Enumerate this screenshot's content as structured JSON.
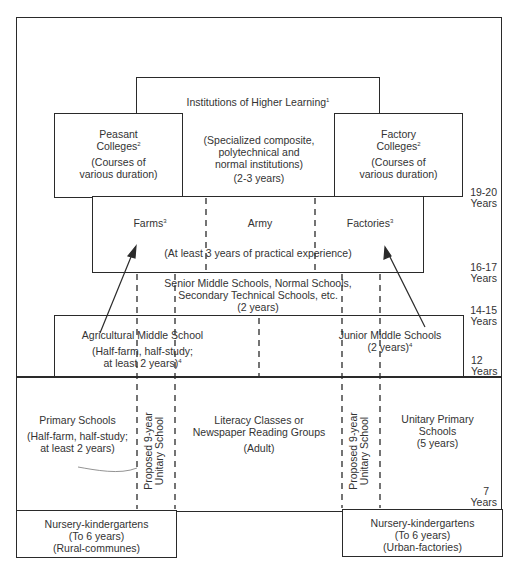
{
  "higher_learning": {
    "title": "Institutions of Higher Learning",
    "footnote": "1",
    "desc_1": "(Specialized composite,",
    "desc_2": "polytechnical and",
    "desc_3": "normal institutions)",
    "duration": "(2-3 years)"
  },
  "peasant_colleges": {
    "title_1": "Peasant",
    "title_2": "Colleges",
    "footnote": "2",
    "desc_1": "(Courses of",
    "desc_2": "various duration)"
  },
  "factory_colleges": {
    "title_1": "Factory",
    "title_2": "Colleges",
    "footnote": "2",
    "desc_1": "(Courses of",
    "desc_2": "various duration)"
  },
  "practical": {
    "farms": "Farms",
    "farms_footnote": "3",
    "army": "Army",
    "factories": "Factories",
    "factories_footnote": "3",
    "desc": "(At least 3 years of practical experience)"
  },
  "senior_middle": {
    "line_1": "Senior Middle Schools, Normal Schools,",
    "line_2": "Secondary Technical Schools, etc.",
    "duration": "(2 years)"
  },
  "agricultural_middle": {
    "title": "Agricultural Middle School",
    "desc_1": "(Half-farm, half-study;",
    "desc_2": "at least 2 years)",
    "footnote": "4"
  },
  "junior_middle": {
    "title": "Junior Middle Schools",
    "duration": "(2 years)",
    "footnote": "4"
  },
  "primary": {
    "title": "Primary Schools",
    "desc_1": "(Half-farm, half-study;",
    "desc_2": "at least 2 years)"
  },
  "proposed_left": {
    "line_1": "Proposed 9-year",
    "line_2": "Unitary School"
  },
  "proposed_right": {
    "line_1": "Proposed 9-year",
    "line_2": "Unitary School"
  },
  "literacy": {
    "line_1": "Literacy Classes or",
    "line_2": "Newspaper Reading Groups",
    "line_3": "(Adult)"
  },
  "unitary_primary": {
    "line_1": "Unitary Primary",
    "line_2": "Schools",
    "duration": "(5 years)"
  },
  "nursery_rural": {
    "title": "Nursery-kindergartens",
    "age": "(To 6 years)",
    "type": "(Rural-communes)"
  },
  "nursery_urban": {
    "title": "Nursery-kindergartens",
    "age": "(To 6 years)",
    "type": "(Urban-factories)"
  },
  "age_labels": [
    {
      "num": "19-20",
      "unit": "Years"
    },
    {
      "num": "16-17",
      "unit": "Years"
    },
    {
      "num": "14-15",
      "unit": "Years"
    },
    {
      "num": "12",
      "unit": "Years"
    },
    {
      "num": "7",
      "unit": "Years"
    }
  ]
}
